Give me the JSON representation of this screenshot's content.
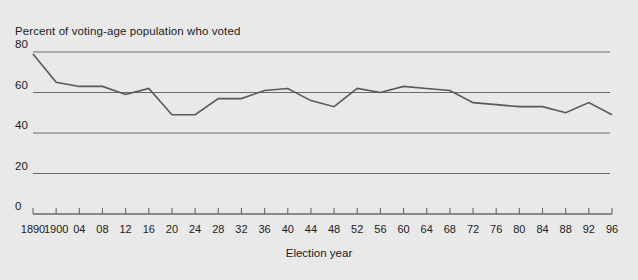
{
  "chart_data": {
    "type": "line",
    "title": "Percent of voting-age population who voted",
    "xlabel": "Election year",
    "ylabel": "",
    "xlim": [
      1890,
      1996
    ],
    "ylim": [
      0,
      88
    ],
    "grid": true,
    "legend": false,
    "yticks": [
      0,
      20,
      40,
      60,
      80
    ],
    "ytick_labels": [
      "0",
      "20",
      "40",
      "60",
      "80"
    ],
    "xtick_labels": [
      "1890",
      "1900",
      "04",
      "08",
      "12",
      "16",
      "20",
      "24",
      "28",
      "32",
      "36",
      "40",
      "44",
      "48",
      "52",
      "56",
      "60",
      "64",
      "68",
      "72",
      "76",
      "80",
      "84",
      "88",
      "92",
      "96"
    ],
    "x": [
      1890,
      1900,
      1904,
      1908,
      1912,
      1916,
      1920,
      1924,
      1928,
      1932,
      1936,
      1940,
      1944,
      1948,
      1952,
      1956,
      1960,
      1964,
      1968,
      1972,
      1976,
      1980,
      1984,
      1988,
      1992,
      1996
    ],
    "values": [
      79,
      65,
      63,
      63,
      59,
      62,
      49,
      49,
      57,
      57,
      61,
      62,
      56,
      53,
      62,
      60,
      63,
      62,
      61,
      55,
      54,
      53,
      53,
      50,
      55,
      49
    ],
    "line_color": "#595959",
    "grid_color": "#6a6a6a",
    "background_color": "#e9e9e9"
  }
}
